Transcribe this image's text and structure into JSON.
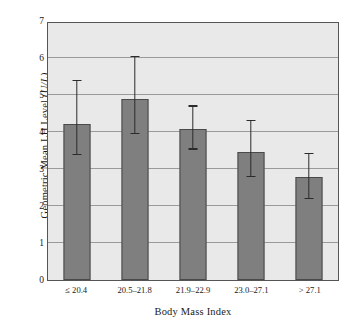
{
  "chart_data": {
    "type": "bar",
    "title": "",
    "xlabel": "Body Mass Index",
    "ylabel_prefix": "Geometric Mean LH Level ",
    "ylabel_unit": "(U/L)",
    "ylabel_full": "Geometric Mean LH Level (U/L)",
    "categories": [
      "≤ 20.4",
      "20.5–21.8",
      "21.9–22.9",
      "23.0–27.1",
      "> 27.1"
    ],
    "values": [
      4.22,
      4.89,
      4.08,
      3.47,
      2.78
    ],
    "errors_low": [
      3.37,
      3.94,
      3.52,
      2.78,
      2.19
    ],
    "errors_high": [
      5.38,
      6.03,
      4.68,
      4.3,
      3.4
    ],
    "ylim": [
      0,
      7
    ],
    "ytick_values": [
      0,
      1,
      2,
      3,
      4,
      5,
      6,
      7
    ],
    "ytick_labels": [
      "0",
      "1",
      "2",
      "3",
      "4",
      "5",
      "6",
      "7"
    ],
    "grid": true,
    "legend": "none",
    "bar_color": "#7f7f7f",
    "bar_edge_color": "#4a4a4a",
    "error_color": "#2b2b2b",
    "plot_background": "#e9e9e9",
    "gridline_color": "#9a9a9a",
    "frame_color": "#555555"
  }
}
